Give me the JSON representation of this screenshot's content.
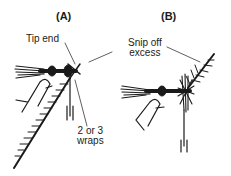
{
  "figure": {
    "panels": [
      {
        "id": "A",
        "label": "(A)",
        "callouts": [
          {
            "text": "Tip end"
          },
          {
            "text": "2 or 3\nwraps"
          }
        ]
      },
      {
        "id": "B",
        "label": "(B)",
        "callouts": [
          {
            "text": "Snip off\nexcess"
          }
        ]
      }
    ],
    "colors": {
      "ink": "#1a1a1a",
      "background": "#ffffff"
    }
  }
}
